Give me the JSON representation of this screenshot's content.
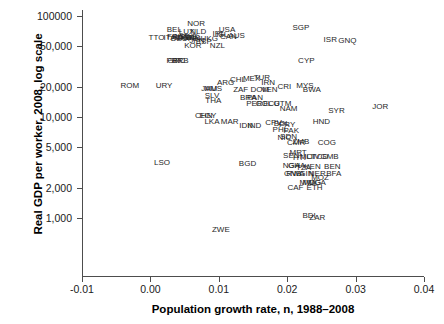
{
  "chart_data": {
    "type": "scatter",
    "title": "",
    "subtitle": "",
    "xlabel": "Population growth rate, n, 1988–2008",
    "ylabel": "Real GDP per worker, 2008, log scale",
    "xlim": [
      -0.013,
      0.041
    ],
    "ylim": [
      700,
      130000
    ],
    "yscale": "log",
    "grid": false,
    "legend": "none",
    "point_marker": "text-label",
    "xticks": [
      -0.01,
      0.0,
      0.01,
      0.02,
      0.03,
      0.04
    ],
    "xtick_labels": [
      "-0.01",
      "0.00",
      "0.01",
      "0.02",
      "0.03",
      "0.04"
    ],
    "yticks": [
      100000,
      50000,
      20000,
      10000,
      5000,
      2000,
      1000
    ],
    "ytick_labels": [
      "100000",
      "50,000",
      "20,000",
      "10,000",
      "5,000",
      "2,000",
      "1,000"
    ],
    "points": [
      {
        "label": "NOR",
        "x": 0.0067,
        "y": 84000
      },
      {
        "label": "BEL",
        "x": 0.0035,
        "y": 72000
      },
      {
        "label": "LUX",
        "x": 0.0053,
        "y": 70000
      },
      {
        "label": "NLD",
        "x": 0.007,
        "y": 70000
      },
      {
        "label": "USA",
        "x": 0.0112,
        "y": 72000
      },
      {
        "label": "IRL",
        "x": 0.01,
        "y": 66000
      },
      {
        "label": "ISL",
        "x": 0.0105,
        "y": 65000
      },
      {
        "label": "CAN",
        "x": 0.0114,
        "y": 62000
      },
      {
        "label": "AUS",
        "x": 0.0126,
        "y": 63000
      },
      {
        "label": "TTO",
        "x": 0.0009,
        "y": 61000
      },
      {
        "label": "ITA",
        "x": 0.0028,
        "y": 61000
      },
      {
        "label": "FRA",
        "x": 0.0036,
        "y": 62000
      },
      {
        "label": "AUT",
        "x": 0.0044,
        "y": 62000
      },
      {
        "label": "CHE",
        "x": 0.0048,
        "y": 61000
      },
      {
        "label": "DNK",
        "x": 0.0052,
        "y": 61000
      },
      {
        "label": "SWE",
        "x": 0.0056,
        "y": 62000
      },
      {
        "label": "DEU",
        "x": 0.0042,
        "y": 59000
      },
      {
        "label": "GBR",
        "x": 0.006,
        "y": 60000
      },
      {
        "label": "FIN",
        "x": 0.0064,
        "y": 59000
      },
      {
        "label": "JPN",
        "x": 0.0068,
        "y": 57000
      },
      {
        "label": "HKG",
        "x": 0.0086,
        "y": 59000
      },
      {
        "label": "ESP",
        "x": 0.0078,
        "y": 55000
      },
      {
        "label": "KOR",
        "x": 0.0062,
        "y": 50000
      },
      {
        "label": "NZL",
        "x": 0.0098,
        "y": 50000
      },
      {
        "label": "SGP",
        "x": 0.022,
        "y": 76000
      },
      {
        "label": "ISR",
        "x": 0.0263,
        "y": 58000
      },
      {
        "label": "GNQ",
        "x": 0.0288,
        "y": 57000
      },
      {
        "label": "CYP",
        "x": 0.0228,
        "y": 36000
      },
      {
        "label": "PRT",
        "x": 0.0035,
        "y": 36000
      },
      {
        "label": "GRC",
        "x": 0.0038,
        "y": 36000
      },
      {
        "label": "BRB",
        "x": 0.0044,
        "y": 36000
      },
      {
        "label": "ROM",
        "x": -0.003,
        "y": 20500
      },
      {
        "label": "URY",
        "x": 0.002,
        "y": 20500
      },
      {
        "label": "ARG",
        "x": 0.011,
        "y": 21500
      },
      {
        "label": "CHL",
        "x": 0.0128,
        "y": 23500
      },
      {
        "label": "MEX",
        "x": 0.0148,
        "y": 24000
      },
      {
        "label": "TUR",
        "x": 0.0163,
        "y": 24500
      },
      {
        "label": "IRN",
        "x": 0.0172,
        "y": 21500
      },
      {
        "label": "CRI",
        "x": 0.0196,
        "y": 20000
      },
      {
        "label": "MYS",
        "x": 0.0226,
        "y": 20500
      },
      {
        "label": "MUS",
        "x": 0.0092,
        "y": 19000
      },
      {
        "label": "JAM",
        "x": 0.0086,
        "y": 19000
      },
      {
        "label": "ZAF",
        "x": 0.0132,
        "y": 18500
      },
      {
        "label": "DOM",
        "x": 0.016,
        "y": 18500
      },
      {
        "label": "VEN",
        "x": 0.0174,
        "y": 18500
      },
      {
        "label": "BWA",
        "x": 0.0236,
        "y": 18500
      },
      {
        "label": "SLV",
        "x": 0.009,
        "y": 16000
      },
      {
        "label": "BRA",
        "x": 0.0143,
        "y": 15500
      },
      {
        "label": "PAN",
        "x": 0.0153,
        "y": 15500
      },
      {
        "label": "THA",
        "x": 0.0092,
        "y": 14500
      },
      {
        "label": "PER",
        "x": 0.0152,
        "y": 13500
      },
      {
        "label": "COL",
        "x": 0.0166,
        "y": 13500
      },
      {
        "label": "ECU",
        "x": 0.0177,
        "y": 13500
      },
      {
        "label": "GTM",
        "x": 0.0193,
        "y": 13500
      },
      {
        "label": "NAM",
        "x": 0.0202,
        "y": 12000
      },
      {
        "label": "SYR",
        "x": 0.0272,
        "y": 11500
      },
      {
        "label": "JOR",
        "x": 0.0336,
        "y": 12500
      },
      {
        "label": "CHN",
        "x": 0.0078,
        "y": 10200
      },
      {
        "label": "EGY",
        "x": 0.0084,
        "y": 10200
      },
      {
        "label": "LKA",
        "x": 0.009,
        "y": 9000
      },
      {
        "label": "MAR",
        "x": 0.0116,
        "y": 9000
      },
      {
        "label": "IDN",
        "x": 0.014,
        "y": 8200
      },
      {
        "label": "IND",
        "x": 0.0152,
        "y": 8200
      },
      {
        "label": "CPV",
        "x": 0.018,
        "y": 8700
      },
      {
        "label": "BOL",
        "x": 0.0192,
        "y": 8500
      },
      {
        "label": "PRY",
        "x": 0.02,
        "y": 8300
      },
      {
        "label": "PHL",
        "x": 0.019,
        "y": 7500
      },
      {
        "label": "PAK",
        "x": 0.0206,
        "y": 7300
      },
      {
        "label": "HND",
        "x": 0.025,
        "y": 9000
      },
      {
        "label": "NIC",
        "x": 0.0196,
        "y": 6200
      },
      {
        "label": "SDN",
        "x": 0.0202,
        "y": 6400
      },
      {
        "label": "ZMB",
        "x": 0.022,
        "y": 5700
      },
      {
        "label": "CMR",
        "x": 0.0213,
        "y": 5500
      },
      {
        "label": "COG",
        "x": 0.0258,
        "y": 5500
      },
      {
        "label": "SEN",
        "x": 0.0206,
        "y": 4100
      },
      {
        "label": "MRT",
        "x": 0.0216,
        "y": 4400
      },
      {
        "label": "MLI",
        "x": 0.0228,
        "y": 4000
      },
      {
        "label": "CIV",
        "x": 0.0238,
        "y": 4000
      },
      {
        "label": "TCD",
        "x": 0.0248,
        "y": 4000
      },
      {
        "label": "GMB",
        "x": 0.0262,
        "y": 4000
      },
      {
        "label": "HTI",
        "x": 0.0218,
        "y": 3900
      },
      {
        "label": "LSO",
        "x": 0.0017,
        "y": 3500
      },
      {
        "label": "BGD",
        "x": 0.0142,
        "y": 3400
      },
      {
        "label": "NGA",
        "x": 0.0206,
        "y": 3300
      },
      {
        "label": "GHA",
        "x": 0.0214,
        "y": 3300
      },
      {
        "label": "TZA",
        "x": 0.0224,
        "y": 3100
      },
      {
        "label": "KEN",
        "x": 0.0237,
        "y": 3200
      },
      {
        "label": "BEN",
        "x": 0.0266,
        "y": 3200
      },
      {
        "label": "GIN",
        "x": 0.0228,
        "y": 2700
      },
      {
        "label": "GNB",
        "x": 0.0208,
        "y": 2700
      },
      {
        "label": "RWA",
        "x": 0.0212,
        "y": 2700
      },
      {
        "label": "NER",
        "x": 0.0244,
        "y": 2700
      },
      {
        "label": "BFA",
        "x": 0.0268,
        "y": 2700
      },
      {
        "label": "MOZ",
        "x": 0.0248,
        "y": 2500
      },
      {
        "label": "MWI",
        "x": 0.023,
        "y": 2200
      },
      {
        "label": "UGA",
        "x": 0.0244,
        "y": 2200
      },
      {
        "label": "MDG",
        "x": 0.0236,
        "y": 2200
      },
      {
        "label": "CAF",
        "x": 0.0212,
        "y": 2000
      },
      {
        "label": "ETH",
        "x": 0.024,
        "y": 2000
      },
      {
        "label": "BDI",
        "x": 0.0232,
        "y": 1050
      },
      {
        "label": "ZAR",
        "x": 0.0244,
        "y": 1000
      },
      {
        "label": "ZWE",
        "x": 0.0103,
        "y": 760
      }
    ]
  }
}
